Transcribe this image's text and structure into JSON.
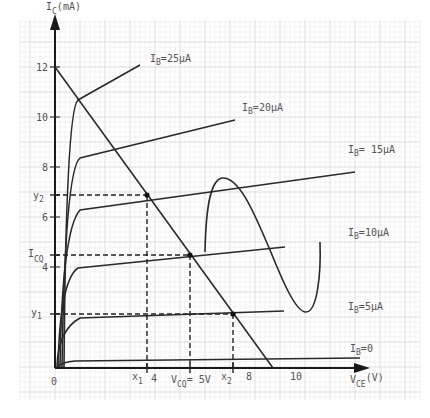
{
  "chart_data": {
    "type": "line",
    "xlabel": "V_CE (V)",
    "ylabel": "I_C (mA)",
    "x_tick_labels": [
      "0",
      "4",
      "8",
      "10"
    ],
    "y_tick_labels": [
      "4",
      "6",
      "8",
      "10",
      "12"
    ],
    "xlim": [
      0,
      11
    ],
    "ylim": [
      0,
      12.5
    ],
    "grid": true,
    "series": [
      {
        "name": "I_B=0",
        "saturation_mA": 0.2
      },
      {
        "name": "I_B=5μA",
        "saturation_mA": 2.0
      },
      {
        "name": "I_B=10μA",
        "saturation_mA": 4.0
      },
      {
        "name": "I_B=15μA",
        "saturation_mA": 6.0
      },
      {
        "name": "I_B=20μA",
        "saturation_mA": 8.4
      },
      {
        "name": "I_B=25μA",
        "saturation_mA": 10.5
      }
    ],
    "load_line": {
      "x_intercept_V": 10,
      "y_intercept_mA": 12
    },
    "q_point": {
      "V_CQ": 5,
      "I_CQ_mA": 4.5
    },
    "annotations": [
      "y2",
      "I_CQ",
      "y1",
      "x1",
      "V_CQ= 5V",
      "x2"
    ]
  },
  "labels": {
    "y_axis_main": "I",
    "y_axis_sub": "C",
    "y_axis_unit": "(mA)",
    "x_axis_main": "V",
    "x_axis_sub": "CE",
    "x_axis_unit": "(V)",
    "origin": "0",
    "y_ticks": [
      {
        "text": "12",
        "y": 67
      },
      {
        "text": "10",
        "y": 117
      },
      {
        "text": "8",
        "y": 167
      },
      {
        "text": "6",
        "y": 217
      },
      {
        "text": "4",
        "y": 267
      }
    ],
    "x_ticks": [
      {
        "text": "4",
        "x": 153
      },
      {
        "text": "8",
        "x": 248
      },
      {
        "text": "10",
        "x": 297
      }
    ],
    "curves": [
      {
        "main": "I",
        "sub": "B",
        "value": "=25μA"
      },
      {
        "main": "I",
        "sub": "B",
        "value": "=20μA"
      },
      {
        "main": "I",
        "sub": "B",
        "value": "= 15μA"
      },
      {
        "main": "I",
        "sub": "B",
        "value": "=10μA"
      },
      {
        "main": "I",
        "sub": "B",
        "value": "=5μA"
      },
      {
        "main": "I",
        "sub": "B",
        "value": "=0"
      }
    ],
    "y2": {
      "main": "y",
      "sub": "2"
    },
    "icq": {
      "main": "I",
      "sub": "CQ"
    },
    "y1": {
      "main": "y",
      "sub": "1"
    },
    "x1": {
      "main": "x",
      "sub": "1"
    },
    "vcq": {
      "main": "V",
      "sub": "CQ",
      "value": "= 5V"
    },
    "x2": {
      "main": "x",
      "sub": "2"
    }
  },
  "colors": {
    "curve": "#2a2a2a",
    "text": "#555555",
    "grid_major": "#cfcfcf",
    "grid_minor": "#e6e6e6"
  }
}
